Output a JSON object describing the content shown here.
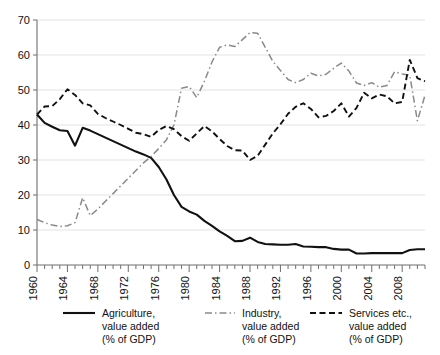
{
  "chart_data": {
    "type": "line",
    "title": "",
    "subtitle": "",
    "xlabel": "",
    "ylabel": "",
    "xlim": [
      1960,
      2011
    ],
    "ylim": [
      0,
      70
    ],
    "ytick_step": 10,
    "xtick_step": 4,
    "minor_xticks": "every 1 year",
    "grid": "horizontal",
    "legend_position": "bottom",
    "ytick_labels": [
      "0",
      "10",
      "20",
      "30",
      "40",
      "50",
      "60",
      "70"
    ],
    "ytick_values": [
      0,
      10,
      20,
      30,
      40,
      50,
      60,
      70
    ],
    "xtick_labels": [
      "1960",
      "1964",
      "1968",
      "1972",
      "1976",
      "1980",
      "1984",
      "1988",
      "1992",
      "1996",
      "2000",
      "2004",
      "2008"
    ],
    "xtick_values": [
      1960,
      1964,
      1968,
      1972,
      1976,
      1980,
      1984,
      1988,
      1992,
      1996,
      2000,
      2004,
      2008
    ],
    "x": [
      1960,
      1961,
      1962,
      1963,
      1964,
      1965,
      1966,
      1967,
      1968,
      1969,
      1970,
      1971,
      1972,
      1973,
      1974,
      1975,
      1976,
      1977,
      1978,
      1979,
      1980,
      1981,
      1982,
      1983,
      1984,
      1985,
      1986,
      1987,
      1988,
      1989,
      1990,
      1991,
      1992,
      1993,
      1994,
      1995,
      1996,
      1997,
      1998,
      1999,
      2000,
      2001,
      2002,
      2003,
      2004,
      2005,
      2006,
      2007,
      2008,
      2009,
      2010,
      2011
    ],
    "series": [
      {
        "name": "Agriculture, value added (% of GDP)",
        "style": "solid",
        "color": "#111111",
        "values": [
          43.0,
          40.6,
          39.5,
          38.5,
          38.3,
          34.1,
          39.2,
          38.4,
          37.4,
          36.4,
          35.4,
          34.4,
          33.4,
          32.4,
          31.6,
          30.6,
          28.0,
          24.5,
          20.0,
          16.6,
          15.3,
          14.4,
          12.6,
          11.2,
          9.6,
          8.3,
          6.8,
          6.9,
          7.8,
          6.6,
          6.0,
          5.9,
          5.8,
          5.8,
          6.0,
          5.3,
          5.2,
          5.1,
          5.1,
          4.6,
          4.4,
          4.4,
          3.3,
          3.3,
          3.4,
          3.4,
          3.4,
          3.4,
          3.4,
          4.3,
          4.5,
          4.5
        ]
      },
      {
        "name": "Industry, value added (% of GDP)",
        "style": "dashdot",
        "color": "#8a8a8a",
        "values": [
          13.0,
          12.1,
          11.4,
          11.0,
          11.2,
          12.1,
          19.2,
          14.1,
          16.0,
          18.2,
          20.4,
          22.6,
          24.8,
          27.0,
          29.2,
          31.0,
          33.3,
          35.7,
          40.0,
          50.5,
          51.0,
          47.8,
          52.5,
          58.0,
          62.2,
          62.9,
          62.4,
          64.4,
          66.4,
          66.2,
          62.2,
          58.2,
          55.6,
          53.0,
          52.1,
          53.0,
          54.8,
          54.0,
          54.5,
          56.2,
          57.7,
          55.4,
          52.0,
          51.3,
          52.1,
          50.8,
          51.3,
          55.2,
          54.6,
          54.2,
          41.2,
          48.5
        ]
      },
      {
        "name": "Services etc., value added (% of GDP)",
        "style": "dashed",
        "color": "#111111",
        "values": [
          43.0,
          45.3,
          45.4,
          47.4,
          50.2,
          48.6,
          46.2,
          45.6,
          43.2,
          42.0,
          41.0,
          40.0,
          38.9,
          37.8,
          37.4,
          36.6,
          38.6,
          39.7,
          38.8,
          36.8,
          35.5,
          37.6,
          39.7,
          38.2,
          36.0,
          34.0,
          32.8,
          32.7,
          30.0,
          31.2,
          34.4,
          37.6,
          40.2,
          43.2,
          45.2,
          46.2,
          44.6,
          42.2,
          42.6,
          44.0,
          46.2,
          42.4,
          44.9,
          49.2,
          47.6,
          48.7,
          48.2,
          46.2,
          46.6,
          58.6,
          53.4,
          52.5
        ]
      }
    ]
  },
  "legend": {
    "items": [
      {
        "line1": "Agriculture,",
        "line2": "value added",
        "line3": "(% of GDP)",
        "marker": "solid-line-swatch"
      },
      {
        "line1": "Industry,",
        "line2": "value added",
        "line3": "(% of GDP)",
        "marker": "dashdot-line-swatch"
      },
      {
        "line1": "Services etc.,",
        "line2": "value added",
        "line3": "(% of GDP)",
        "marker": "dashed-line-swatch"
      }
    ]
  }
}
